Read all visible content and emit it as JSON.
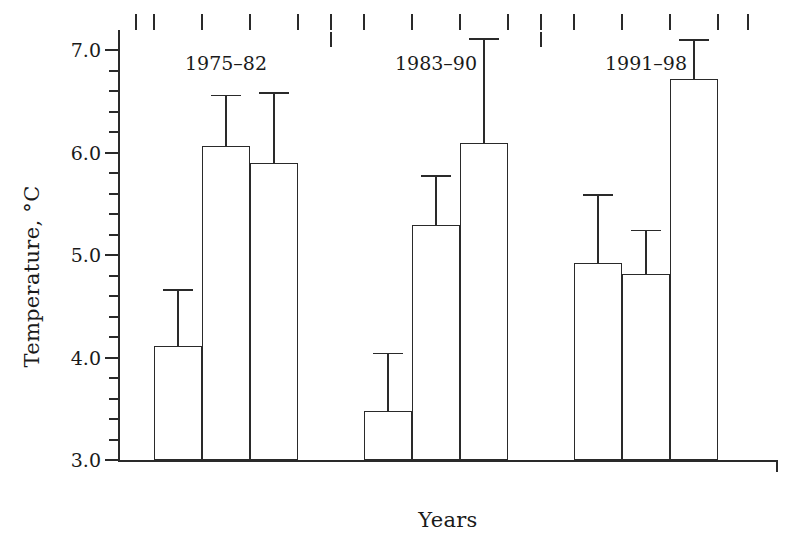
{
  "chart_data": {
    "type": "bar",
    "title": "",
    "xlabel": "Years",
    "ylabel": "Temperature, °C",
    "ylim": [
      3.0,
      7.2
    ],
    "yticks": [
      3.0,
      4.0,
      5.0,
      6.0,
      7.0
    ],
    "ytick_labels": [
      "3.0",
      "4.0",
      "5.0",
      "6.0",
      "7.0"
    ],
    "yminor_step": 0.2,
    "grid": false,
    "legend": null,
    "error_bars": "upper-only",
    "categories": [
      "1975–82",
      "1983–90",
      "1991–98"
    ],
    "bars_per_group": 3,
    "series": [
      {
        "name": "bar-1",
        "values": [
          4.11,
          3.48,
          4.92
        ],
        "errors_upper": [
          4.67,
          4.05,
          5.6
        ]
      },
      {
        "name": "bar-2",
        "values": [
          6.07,
          5.3,
          4.82
        ],
        "errors_upper": [
          6.57,
          5.78,
          5.25
        ]
      },
      {
        "name": "bar-3",
        "values": [
          5.9,
          6.1,
          6.72
        ],
        "errors_upper": [
          6.59,
          7.12,
          7.11
        ]
      }
    ],
    "groups": [
      {
        "label": "1975–82",
        "bars": [
          {
            "value": 4.11,
            "error_top": 4.67
          },
          {
            "value": 6.07,
            "error_top": 6.57
          },
          {
            "value": 5.9,
            "error_top": 6.59
          }
        ]
      },
      {
        "label": "1983–90",
        "bars": [
          {
            "value": 3.48,
            "error_top": 4.05
          },
          {
            "value": 5.3,
            "error_top": 5.78
          },
          {
            "value": 6.1,
            "error_top": 7.12
          }
        ]
      },
      {
        "label": "1991–98",
        "bars": [
          {
            "value": 4.92,
            "error_top": 5.6
          },
          {
            "value": 4.82,
            "error_top": 5.25
          },
          {
            "value": 6.72,
            "error_top": 7.11
          }
        ]
      }
    ],
    "colors": {
      "bar_fill": "#ffffff",
      "bar_edge": "#2a2a2a",
      "axis": "#2a2a2a",
      "text": "#1a1a1a",
      "background": "#ffffff"
    }
  }
}
